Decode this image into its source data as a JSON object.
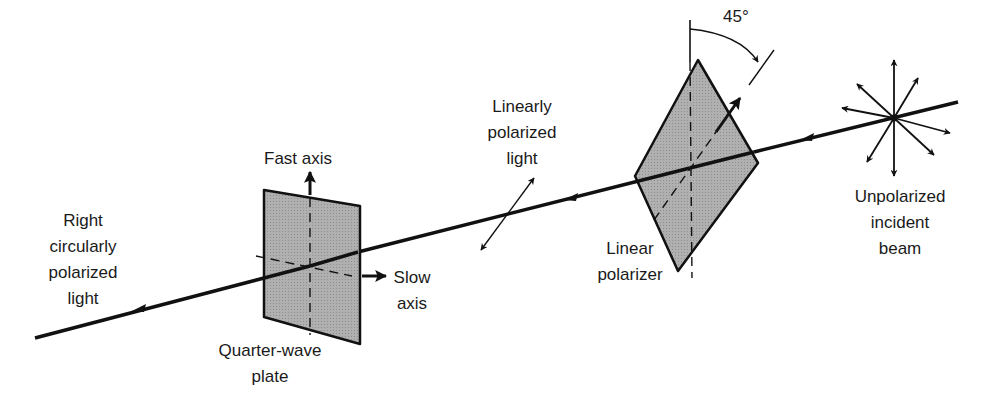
{
  "diagram": {
    "colors": {
      "line": "#111111",
      "plate_fill": "#a9a9a9",
      "background": "#ffffff"
    },
    "labels": {
      "angle": "45°",
      "linearly_polarized": [
        "Linearly",
        "polarized",
        "light"
      ],
      "linear_polarizer": [
        "Linear",
        "polarizer"
      ],
      "unpolarized": [
        "Unpolarized",
        "incident",
        "beam"
      ],
      "fast_axis": "Fast axis",
      "slow_axis": [
        "Slow",
        "axis"
      ],
      "quarter_wave": [
        "Quarter-wave",
        "plate"
      ],
      "right_circular": [
        "Right",
        "circularly",
        "polarized",
        "light"
      ]
    }
  }
}
